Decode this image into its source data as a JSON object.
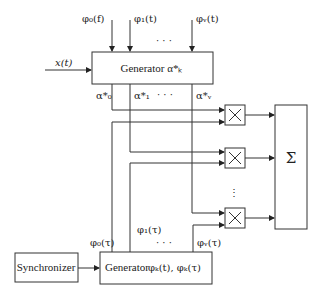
{
  "diagram": {
    "inputs_top": [
      {
        "id": "phi0",
        "label": "φ₀(f)"
      },
      {
        "id": "phi1",
        "label": "φ₁(t)"
      },
      {
        "id": "phinu",
        "label": "φᵥ(t)"
      }
    ],
    "input_ellipsis": "· · ·",
    "signal_input": "x(t)",
    "top_generator": {
      "label": "Generator α*ₖ"
    },
    "alpha_outputs": [
      {
        "id": "a0",
        "label": "α*₀"
      },
      {
        "id": "a1",
        "label": "α*₁"
      },
      {
        "id": "anu",
        "label": "α*ᵥ"
      }
    ],
    "alpha_ellipsis": "· · ·",
    "multipliers": [
      {
        "id": "m0",
        "symbol": "×"
      },
      {
        "id": "m1",
        "symbol": "×"
      },
      {
        "id": "mnu",
        "symbol": "×"
      }
    ],
    "multiplier_ellipsis": "⋮",
    "summer": {
      "symbol": "Σ"
    },
    "synchronizer": {
      "label": "Synchronizer"
    },
    "bottom_generator": {
      "label": "Generator",
      "outputs_label": "φₖ(t), φₖ(τ)"
    },
    "bottom_outputs": [
      {
        "id": "p0",
        "label": "φ₀(τ)"
      },
      {
        "id": "p1",
        "label": "φ₁(τ)"
      },
      {
        "id": "pnu",
        "label": "φᵥ(τ)"
      }
    ],
    "bottom_ellipsis": "· · ·"
  }
}
